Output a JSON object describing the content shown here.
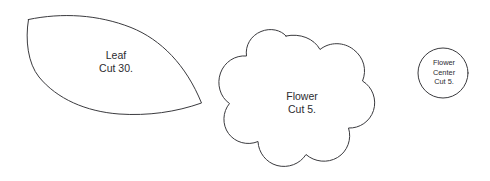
{
  "sheet": {
    "title": "Applique Pattern Template Sheet",
    "background_color": "#ffffff",
    "outline_color": "#3a3a3e",
    "text_color": "#2b2b2f",
    "width": 490,
    "height": 181
  },
  "pieces": [
    {
      "id": "leaf",
      "shape": "leaf",
      "name": "Leaf",
      "label_lines": [
        "Leaf",
        "Cut 30."
      ],
      "cut_quantity": "30",
      "cut_text": "Cut 30."
    },
    {
      "id": "flower",
      "shape": "flower",
      "name": "Flower",
      "label_lines": [
        "Flower",
        "Cut 5."
      ],
      "cut_quantity": "5",
      "cut_text": "Cut 5."
    },
    {
      "id": "flower-center",
      "shape": "circle",
      "name": "Flower Center",
      "label_lines": [
        "Flower",
        "Center",
        "Cut 5."
      ],
      "cut_quantity": "5",
      "cut_text": "Cut 5."
    }
  ]
}
